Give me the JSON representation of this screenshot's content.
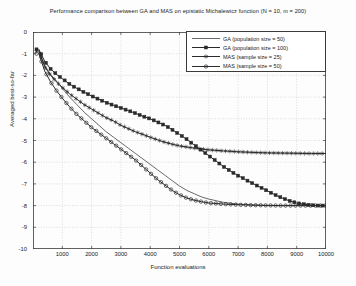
{
  "chart_data": {
    "type": "line",
    "title": "Performance comparison between GA and MAS on epistatic Michalewicz function (N = 10, m = 200)",
    "xlabel": "Function evaluations",
    "ylabel": "Averaged best-so-far",
    "xlim": [
      0,
      10000
    ],
    "ylim": [
      -10,
      0
    ],
    "xticks": [
      1000,
      2000,
      3000,
      4000,
      5000,
      6000,
      7000,
      8000,
      9000,
      10000
    ],
    "yticks": [
      0,
      -1,
      -2,
      -3,
      -4,
      -5,
      -6,
      -7,
      -8,
      -9,
      -10
    ],
    "grid": true,
    "legend_position": "top-right",
    "series": [
      {
        "name": "GA (population size = 50)",
        "marker": "none",
        "color": "#2a2a2a",
        "x": [
          200,
          400,
          600,
          800,
          1000,
          1250,
          1500,
          1750,
          2000,
          2250,
          2500,
          2750,
          3000,
          3250,
          3500,
          3750,
          4000,
          4250,
          4500,
          4750,
          5000,
          5250,
          5500,
          5750,
          6000,
          6500,
          7000,
          7500,
          8000,
          8500,
          9000,
          9500,
          10000
        ],
        "y": [
          -0.85,
          -1.55,
          -1.95,
          -2.25,
          -2.6,
          -3.0,
          -3.35,
          -3.7,
          -4.0,
          -4.3,
          -4.6,
          -4.85,
          -5.1,
          -5.35,
          -5.6,
          -5.85,
          -6.1,
          -6.35,
          -6.6,
          -6.85,
          -7.1,
          -7.3,
          -7.45,
          -7.6,
          -7.7,
          -7.85,
          -7.93,
          -7.97,
          -8.0,
          -8.0,
          -8.0,
          -8.0,
          -8.0
        ]
      },
      {
        "name": "GA (population size = 100)",
        "marker": "square",
        "color": "#2a2a2a",
        "x": [
          200,
          400,
          600,
          800,
          1000,
          1250,
          1500,
          1750,
          2000,
          2250,
          2500,
          2750,
          3000,
          3250,
          3500,
          3750,
          4000,
          4250,
          4500,
          4750,
          5000,
          5250,
          5500,
          5750,
          6000,
          6250,
          6500,
          6750,
          7000,
          7250,
          7500,
          7750,
          8000,
          8250,
          8500,
          8750,
          9000,
          9250,
          9500,
          9750,
          10000
        ],
        "y": [
          -0.8,
          -1.35,
          -1.7,
          -1.95,
          -2.15,
          -2.4,
          -2.6,
          -2.78,
          -2.95,
          -3.1,
          -3.25,
          -3.38,
          -3.5,
          -3.62,
          -3.75,
          -3.88,
          -4.0,
          -4.15,
          -4.3,
          -4.5,
          -4.72,
          -4.95,
          -5.2,
          -5.45,
          -5.7,
          -5.95,
          -6.2,
          -6.42,
          -6.62,
          -6.8,
          -6.98,
          -7.15,
          -7.32,
          -7.5,
          -7.65,
          -7.78,
          -7.88,
          -7.94,
          -7.98,
          -8.0,
          -8.0
        ]
      },
      {
        "name": "MAS (sample size = 25)",
        "marker": "star",
        "color": "#2a2a2a",
        "x": [
          200,
          400,
          600,
          800,
          1000,
          1250,
          1500,
          1750,
          2000,
          2250,
          2500,
          2750,
          3000,
          3250,
          3500,
          3750,
          4000,
          4250,
          4500,
          4750,
          5000,
          5500,
          6000,
          6500,
          7000,
          7500,
          8000,
          8500,
          9000,
          9500,
          10000
        ],
        "y": [
          -0.9,
          -1.6,
          -2.0,
          -2.3,
          -2.55,
          -2.85,
          -3.1,
          -3.35,
          -3.55,
          -3.75,
          -3.95,
          -4.1,
          -4.3,
          -4.45,
          -4.6,
          -4.72,
          -4.85,
          -4.97,
          -5.08,
          -5.17,
          -5.25,
          -5.35,
          -5.43,
          -5.48,
          -5.52,
          -5.55,
          -5.57,
          -5.58,
          -5.59,
          -5.6,
          -5.6
        ]
      },
      {
        "name": "MAS (sample size = 50)",
        "marker": "circle",
        "color": "#2a2a2a",
        "x": [
          200,
          400,
          600,
          800,
          1000,
          1250,
          1500,
          1750,
          2000,
          2250,
          2500,
          2750,
          3000,
          3250,
          3500,
          3750,
          4000,
          4250,
          4500,
          4750,
          5000,
          5250,
          5500,
          5750,
          6000,
          6500,
          7000,
          7500,
          8000,
          8500,
          9000,
          9500,
          10000
        ],
        "y": [
          -1.0,
          -1.8,
          -2.3,
          -2.7,
          -3.05,
          -3.45,
          -3.8,
          -4.1,
          -4.4,
          -4.65,
          -4.9,
          -5.15,
          -5.4,
          -5.65,
          -5.9,
          -6.2,
          -6.5,
          -6.8,
          -7.05,
          -7.3,
          -7.5,
          -7.65,
          -7.75,
          -7.82,
          -7.88,
          -7.93,
          -7.96,
          -7.98,
          -7.99,
          -8.0,
          -8.0,
          -8.0,
          -8.0
        ]
      }
    ]
  }
}
